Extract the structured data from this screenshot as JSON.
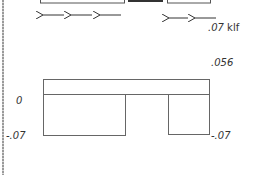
{
  "diagram": {
    "load": {
      "direction": "left",
      "value_label": ".07",
      "unit_label": "klf",
      "arrow_groups": [
        {
          "x_start": 42,
          "x_end": 122,
          "y": 15,
          "count": 3
        },
        {
          "x_start": 168,
          "x_end": 217,
          "y": 18,
          "count": 2
        }
      ]
    },
    "top_members": [
      {
        "name": "left-member",
        "x": 40,
        "w": 84,
        "filled": false
      },
      {
        "name": "middle-member",
        "x": 128,
        "w": 35,
        "filled": true
      },
      {
        "name": "right-member",
        "x": 167,
        "w": 43,
        "filled": false
      }
    ],
    "shear_diagram": {
      "top_value_label": ".056",
      "zero_label": "0",
      "left_bottom_label": "-.07",
      "right_bottom_label": "-.07"
    },
    "colors": {
      "line": "#555555",
      "fill": "#333333",
      "text": "#333333"
    }
  }
}
